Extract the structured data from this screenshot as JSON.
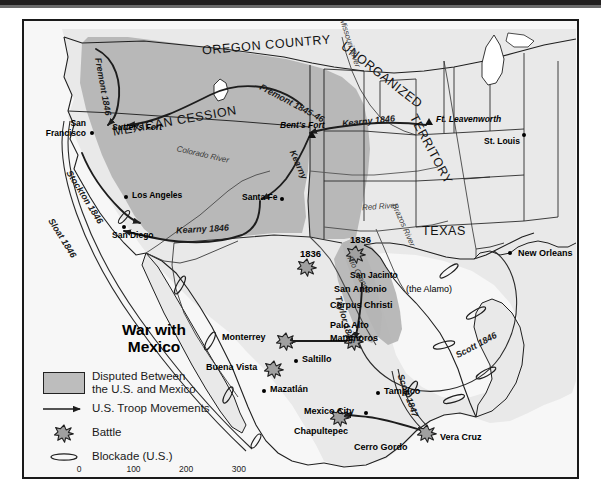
{
  "map": {
    "title_line1": "War with",
    "title_line2": "Mexico",
    "regions": [
      {
        "name": "OREGON COUNTRY"
      },
      {
        "name": "MEXICAN CESSION"
      },
      {
        "name": "UNORGANIZED"
      },
      {
        "name": "TERRITORY"
      },
      {
        "name": "TEXAS"
      }
    ],
    "rivers": [
      {
        "name": "Missouri River"
      },
      {
        "name": "Colorado River"
      },
      {
        "name": "Red River"
      },
      {
        "name": "Brazos River"
      },
      {
        "name": "Rio Grande"
      }
    ],
    "routes": [
      {
        "name": "Fremont 1846"
      },
      {
        "name": "Fremont 1845-46"
      },
      {
        "name": "Kearny 1846"
      },
      {
        "name": "Kearny"
      },
      {
        "name": "Kearny 1846 (southwest)"
      },
      {
        "name": "Stockton 1846"
      },
      {
        "name": "Sloat 1846"
      },
      {
        "name": "Taylor 1846"
      },
      {
        "name": "Scott 1846"
      },
      {
        "name": "Scott 1847"
      }
    ],
    "route_labels": {
      "fremont_1846": "Fremont 1846",
      "fremont_1845_46": "Fremont 1845-46",
      "kearny_1846_east": "Kearny 1846",
      "kearny_diag": "Kearny",
      "kearny_1846_west": "Kearny 1846",
      "stockton_1846": "Stockton 1846",
      "sloat_1846": "Sloat 1846",
      "taylor_1846": "Taylor 1846",
      "scott_1846": "Scott 1846",
      "scott_1847": "Scott 1847"
    },
    "river_labels": {
      "missouri": "Missouri River",
      "colorado": "Colorado River",
      "red": "Red River",
      "brazos": "Brazos River",
      "rio_grande": "Rio Grande"
    },
    "region_labels": {
      "oregon": "OREGON COUNTRY",
      "cession": "MEXICAN CESSION",
      "unorganized": "UNORGANIZED",
      "territory": "TERRITORY",
      "texas": "TEXAS"
    },
    "places": {
      "san_francisco_l1": "San",
      "san_francisco_l2": "Francisco",
      "sutters_fort": "Sutter's Fort",
      "los_angeles": "Los Angeles",
      "san_diego": "San Diego",
      "santa_fe": "Santa Fe",
      "bents_fort": "Bent's Fort",
      "ft_leavenworth": "Ft. Leavenworth",
      "st_louis": "St. Louis",
      "new_orleans": "New Orleans",
      "san_jacinto": "San Jacinto",
      "san_antonio": "San Antonio",
      "san_antonio_paren": "(the Alamo)",
      "corpus_christi": "Corpus Christi",
      "palo_alto": "Palo Alto",
      "matamoros": "Matamoros",
      "monterrey": "Monterrey",
      "saltillo": "Saltillo",
      "buena_vista": "Buena Vista",
      "mazatlan": "Mazatlán",
      "tampico": "Tampico",
      "mexico_city": "Mexico City",
      "chapultepec": "Chapultepec",
      "cerro_gordo": "Cerro Gordo",
      "vera_cruz": "Vera Cruz"
    },
    "battle_years": {
      "alamo_1836": "1836",
      "san_jacinto_1836": "1836"
    }
  },
  "legend": {
    "items": [
      {
        "key": "disputed-swatch",
        "line1": "Disputed Between",
        "line2": "the U.S. and Mexico"
      },
      {
        "key": "arrow-icon",
        "line1": "U.S. Troop Movements",
        "line2": ""
      },
      {
        "key": "battle-star-icon",
        "line1": "Battle",
        "line2": ""
      },
      {
        "key": "blockade-icon",
        "line1": "Blockade (U.S.)",
        "line2": ""
      }
    ]
  },
  "scale": {
    "ticks": [
      "0",
      "100",
      "200",
      "300"
    ],
    "unit": "miles"
  },
  "colors": {
    "disputed_fill": "#b5b5b5",
    "land_fill": "#e9e9e9",
    "water_fill": "#f7f7f7",
    "outline": "#1a1a1a",
    "battle_fill": "#9a9a9a"
  }
}
